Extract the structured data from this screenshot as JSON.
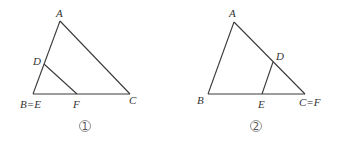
{
  "figures": [
    {
      "caption": "1",
      "vertices": {
        "A": [
          60,
          21
        ],
        "B": [
          33,
          94
        ],
        "C": [
          130,
          94
        ],
        "D": [
          44,
          64
        ],
        "F": [
          77,
          94
        ]
      },
      "labels": {
        "A": "A",
        "D": "D",
        "BE": "B=E",
        "F": "F",
        "C": "C"
      },
      "segments": [
        [
          "A",
          "B"
        ],
        [
          "B",
          "C"
        ],
        [
          "A",
          "C"
        ],
        [
          "D",
          "F"
        ]
      ]
    },
    {
      "caption": "2",
      "vertices": {
        "A": [
          234,
          22
        ],
        "B": [
          208,
          94
        ],
        "C": [
          305,
          94
        ],
        "D": [
          273,
          62
        ],
        "E": [
          262,
          94
        ]
      },
      "labels": {
        "A": "A",
        "D": "D",
        "B": "B",
        "E": "E",
        "CF": "C=F"
      },
      "segments": [
        [
          "A",
          "B"
        ],
        [
          "B",
          "C"
        ],
        [
          "A",
          "C"
        ],
        [
          "D",
          "E"
        ]
      ]
    }
  ]
}
